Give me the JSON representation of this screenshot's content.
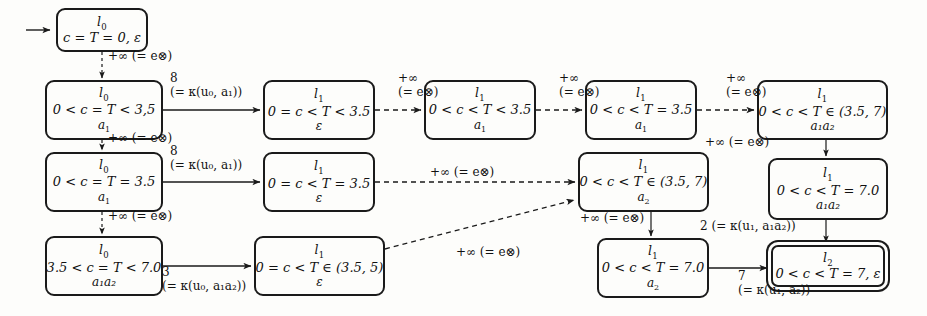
{
  "diagram": {
    "colors": {
      "ink": "#1a1a1a",
      "paper": "#fdfdfb"
    }
  },
  "nodes": [
    {
      "id": "n_init",
      "loc": "l",
      "loc_sub": "0",
      "constraint": "c = T = 0, ε",
      "word": "",
      "accepting": false,
      "x": 56,
      "y": 8,
      "w": 92,
      "h": 44
    },
    {
      "id": "n_a1",
      "loc": "l",
      "loc_sub": "0",
      "constraint": "0 < c = T < 3,5",
      "word": "a",
      "word_sub": "1",
      "accepting": false,
      "x": 45,
      "y": 80,
      "w": 118,
      "h": 60
    },
    {
      "id": "n_b1",
      "loc": "l",
      "loc_sub": "1",
      "constraint": "0 = c < T < 3.5",
      "word": "ε",
      "accepting": false,
      "x": 263,
      "y": 80,
      "w": 112,
      "h": 60
    },
    {
      "id": "n_c1",
      "loc": "l",
      "loc_sub": "1",
      "constraint": "0 < c < T < 3.5",
      "word": "a",
      "word_sub": "1",
      "accepting": false,
      "x": 424,
      "y": 80,
      "w": 112,
      "h": 60
    },
    {
      "id": "n_d1",
      "loc": "l",
      "loc_sub": "1",
      "constraint": "0 < c < T = 3.5",
      "word": "a",
      "word_sub": "1",
      "accepting": false,
      "x": 585,
      "y": 80,
      "w": 112,
      "h": 60
    },
    {
      "id": "n_e1",
      "loc": "l",
      "loc_sub": "1",
      "constraint": "0 < c < T ∈ (3.5, 7)",
      "word": "a₁a₂",
      "accepting": false,
      "x": 757,
      "y": 80,
      "w": 131,
      "h": 60
    },
    {
      "id": "n_a2",
      "loc": "l",
      "loc_sub": "0",
      "constraint": "0 < c = T = 3.5",
      "word": "a",
      "word_sub": "1",
      "accepting": false,
      "x": 45,
      "y": 152,
      "w": 118,
      "h": 60
    },
    {
      "id": "n_b2",
      "loc": "l",
      "loc_sub": "1",
      "constraint": "0 = c < T = 3.5",
      "word": "ε",
      "accepting": false,
      "x": 263,
      "y": 152,
      "w": 112,
      "h": 60
    },
    {
      "id": "n_d2",
      "loc": "l",
      "loc_sub": "1",
      "constraint": "0 < c < T ∈ (3.5, 7)",
      "word": "a",
      "word_sub": "2",
      "accepting": false,
      "x": 578,
      "y": 152,
      "w": 131,
      "h": 60
    },
    {
      "id": "n_e2",
      "loc": "l",
      "loc_sub": "1",
      "constraint": "0 < c < T = 7.0",
      "word": "a₁a₂",
      "accepting": false,
      "x": 768,
      "y": 158,
      "w": 120,
      "h": 62
    },
    {
      "id": "n_a3",
      "loc": "l",
      "loc_sub": "0",
      "constraint": "3.5 < c = T < 7.0",
      "word": "a₁a₂",
      "accepting": false,
      "x": 45,
      "y": 236,
      "w": 118,
      "h": 60
    },
    {
      "id": "n_b3",
      "loc": "l",
      "loc_sub": "1",
      "constraint": "0 = c < T ∈ (3.5, 5)",
      "word": "ε",
      "accepting": false,
      "x": 254,
      "y": 236,
      "w": 131,
      "h": 60
    },
    {
      "id": "n_d3",
      "loc": "l",
      "loc_sub": "1",
      "constraint": "0 < c < T = 7.0",
      "word": "a",
      "word_sub": "2",
      "accepting": false,
      "x": 597,
      "y": 238,
      "w": 112,
      "h": 60
    },
    {
      "id": "n_acc",
      "loc": "l",
      "loc_sub": "2",
      "constraint": "0 < c < T = 7, ε",
      "word": "",
      "accepting": true,
      "x": 771,
      "y": 245,
      "w": 114,
      "h": 42
    }
  ],
  "edge_labels": [
    {
      "id": "lbl_init_a1",
      "line1": "+∞ (= e⊗)",
      "line2": "",
      "x": 86,
      "y": 52,
      "align": "left"
    },
    {
      "id": "lbl_a1_b1",
      "line1": "8",
      "line2": "(= κ(u₀, a₁))",
      "x": 170,
      "y": 73,
      "align": "center"
    },
    {
      "id": "lbl_b1_c1",
      "line1": "+∞",
      "line2": "(= e⊗)",
      "x": 378,
      "y": 73,
      "align": "center"
    },
    {
      "id": "lbl_c1_d1",
      "line1": "+∞",
      "line2": "(= e⊗)",
      "x": 539,
      "y": 73,
      "align": "center"
    },
    {
      "id": "lbl_d1_e1",
      "line1": "+∞",
      "line2": "(= e⊗)",
      "x": 700,
      "y": 73,
      "align": "center"
    },
    {
      "id": "lbl_a1_a2",
      "line1": "+∞ (= e⊗)",
      "line2": "",
      "x": 86,
      "y": 134,
      "align": "left"
    },
    {
      "id": "lbl_a2_b2",
      "line1": "8",
      "line2": "(= κ(u₀, a₁))",
      "x": 170,
      "y": 146,
      "align": "center"
    },
    {
      "id": "lbl_b2_d2",
      "line1": "+∞ (= e⊗)",
      "line2": "",
      "x": 430,
      "y": 170,
      "align": "center"
    },
    {
      "id": "lbl_e1_e2",
      "line1": "+∞ (= e⊗)",
      "line2": "",
      "x": 702,
      "y": 139,
      "align": "left"
    },
    {
      "id": "lbl_a2_a3",
      "line1": "+∞ (= e⊗)",
      "line2": "",
      "x": 86,
      "y": 212,
      "align": "left"
    },
    {
      "id": "lbl_a3_b3",
      "line1": "3",
      "line2": "(= κ(u₀, a₁a₂))",
      "x": 157,
      "y": 267,
      "align": "center"
    },
    {
      "id": "lbl_b3_d2",
      "line1": "+∞ (= e⊗)",
      "line2": "",
      "x": 436,
      "y": 248,
      "align": "center"
    },
    {
      "id": "lbl_d2_d3",
      "line1": "+∞ (= e⊗)",
      "line2": "",
      "x": 580,
      "y": 219,
      "align": "left"
    },
    {
      "id": "lbl_e2_acc",
      "line1": "2 (= κ(u₁, a₁a₂))",
      "line2": "",
      "x": 704,
      "y": 223,
      "align": "left"
    },
    {
      "id": "lbl_d3_acc",
      "line1": "7",
      "line2": "(= κ(u₁, a₂))",
      "x": 705,
      "y": 272,
      "align": "center"
    }
  ],
  "edges": [
    {
      "id": "e_init_a1",
      "from": "n_init",
      "to": "n_a1",
      "style": "dashed",
      "kind": "vertical"
    },
    {
      "id": "e_a1_b1",
      "from": "n_a1",
      "to": "n_b1",
      "style": "solid",
      "kind": "horizontal"
    },
    {
      "id": "e_b1_c1",
      "from": "n_b1",
      "to": "n_c1",
      "style": "dashed",
      "kind": "horizontal"
    },
    {
      "id": "e_c1_d1",
      "from": "n_c1",
      "to": "n_d1",
      "style": "dashed",
      "kind": "horizontal"
    },
    {
      "id": "e_d1_e1",
      "from": "n_d1",
      "to": "n_e1",
      "style": "dashed",
      "kind": "horizontal"
    },
    {
      "id": "e_a1_a2",
      "from": "n_a1",
      "to": "n_a2",
      "style": "dashed",
      "kind": "vertical"
    },
    {
      "id": "e_a2_b2",
      "from": "n_a2",
      "to": "n_b2",
      "style": "solid",
      "kind": "horizontal"
    },
    {
      "id": "e_b2_d2",
      "from": "n_b2",
      "to": "n_d2",
      "style": "dashed",
      "kind": "horizontal"
    },
    {
      "id": "e_e1_e2",
      "from": "n_e1",
      "to": "n_e2",
      "style": "solid",
      "kind": "vertical"
    },
    {
      "id": "e_a2_a3",
      "from": "n_a2",
      "to": "n_a3",
      "style": "dashed",
      "kind": "vertical"
    },
    {
      "id": "e_a3_b3",
      "from": "n_a3",
      "to": "n_b3",
      "style": "solid",
      "kind": "horizontal"
    },
    {
      "id": "e_b3_d2",
      "from": "n_b3",
      "to": "n_d2",
      "style": "dashed",
      "kind": "diagonal"
    },
    {
      "id": "e_d2_d3",
      "from": "n_d2",
      "to": "n_d3",
      "style": "solid",
      "kind": "vertical"
    },
    {
      "id": "e_e2_acc",
      "from": "n_e2",
      "to": "n_acc",
      "style": "solid",
      "kind": "vertical"
    },
    {
      "id": "e_d3_acc",
      "from": "n_d3",
      "to": "n_acc",
      "style": "solid",
      "kind": "horizontal"
    }
  ],
  "start_arrow": {
    "id": "start-arrow",
    "x1": 28,
    "y1": 30,
    "x2": 54,
    "y2": 30
  }
}
